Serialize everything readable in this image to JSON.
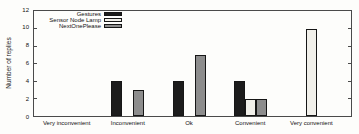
{
  "chart_data": {
    "type": "bar",
    "title": "",
    "xlabel": "",
    "ylabel": "Number of replies",
    "categories": [
      "Very inconvenient",
      "Inconvenient",
      "Ok",
      "Convenient",
      "Very convenient"
    ],
    "series": [
      {
        "name": "Gestures",
        "color": "#1c1c1c",
        "values": [
          0,
          4,
          4,
          4,
          0
        ]
      },
      {
        "name": "Sensor Node Lamp",
        "color": "#f1f0ea",
        "values": [
          0,
          0,
          0,
          2,
          10
        ]
      },
      {
        "name": "NextOnePlease",
        "color": "#8d8d8d",
        "values": [
          0,
          3,
          7,
          2,
          0
        ]
      }
    ],
    "ylim": [
      0,
      12
    ],
    "yticks": [
      0,
      2,
      4,
      6,
      8,
      10,
      12
    ],
    "legend_position": "top-left-inside",
    "grid": false,
    "frame_color": "#4a4a4a"
  }
}
